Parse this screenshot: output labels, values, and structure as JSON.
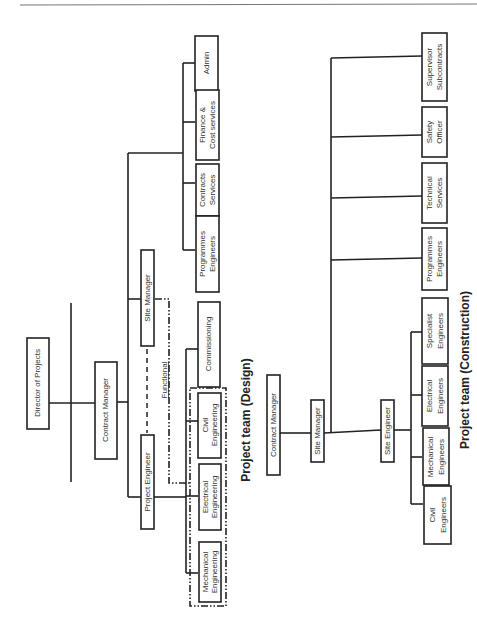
{
  "design": {
    "title": "Project team  (Design)",
    "director": "Director of Projects",
    "contract_manager": "Contract Manager",
    "project_engineer": "Project Engineer",
    "site_manager": "Site Manager",
    "functional_label": "Functional",
    "engineering": {
      "mechanical_1": "Mechanical",
      "mechanical_2": "Engineering",
      "electrical_1": "Electrical",
      "electrical_2": "Engineering",
      "civil_1": "Civil",
      "civil_2": "Engineering"
    },
    "commissioning": "Commissioning",
    "support": {
      "programmes_1": "Programmes",
      "programmes_2": "Engineers",
      "contracts_1": "Contracts",
      "contracts_2": "Services",
      "finance_1": "Finance &",
      "finance_2": "Cost services",
      "admin": "Admin"
    }
  },
  "construction": {
    "title": "Project team  (Construction)",
    "contract_manager": "Contract Manager",
    "site_manager": "Site Manager",
    "site_engineer": "Site Engineer",
    "engineers": {
      "civil_1": "Civil",
      "civil_2": "Engineers",
      "mechanical_1": "Mechanical",
      "mechanical_2": "Engineers",
      "electrical_1": "Electrical",
      "electrical_2": "Engineers",
      "specialist_1": "Specialist",
      "specialist_2": "Engineers"
    },
    "staff": {
      "programmes_1": "Programmes",
      "programmes_2": "Engineers",
      "technical_1": "Technical",
      "technical_2": "Services",
      "safety_1": "Safety",
      "safety_2": "Officer",
      "supervisor_1": "Supervisor",
      "supervisor_2": "Subcontracts"
    }
  }
}
